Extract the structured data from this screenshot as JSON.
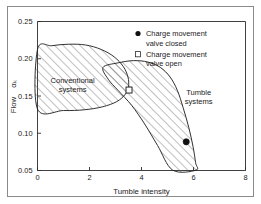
{
  "chart_data": {
    "type": "scatter",
    "title": "",
    "xlabel": "Tumble intensity",
    "ylabel": "Flow αₖ",
    "ylabel_main": "Flow",
    "ylabel_symbol": "αₖ",
    "xlim": [
      0,
      8
    ],
    "ylim": [
      0.05,
      0.25
    ],
    "xticks": [
      0,
      2,
      4,
      6,
      8
    ],
    "xtick_labels": [
      "0",
      "2",
      "4",
      "6",
      "8"
    ],
    "yticks": [
      0.05,
      0.1,
      0.15,
      0.2,
      0.25
    ],
    "ytick_labels": [
      "0.05",
      "0.10",
      "0.15",
      "0.20",
      "0.25"
    ],
    "grid": false,
    "legend_position": "top-right",
    "series": [
      {
        "name": "Charge movement valve closed",
        "marker": "filled-circle",
        "points": [
          {
            "x": 5.72,
            "y": 0.0885
          }
        ]
      },
      {
        "name": "Charge movement valve open",
        "marker": "open-square",
        "points": [
          {
            "x": 3.52,
            "y": 0.158
          }
        ]
      }
    ],
    "regions": [
      {
        "name": "Conventional systems",
        "label": "Conventional\nsystems",
        "label_line1": "Conventional",
        "label_line2": "systems",
        "hatch": "diagonal",
        "label_x": 1.35,
        "label_y": 0.168,
        "boundary": [
          {
            "x": 0.0,
            "y": 0.2125
          },
          {
            "x": 0.55,
            "y": 0.2175
          },
          {
            "x": 1.2,
            "y": 0.2195
          },
          {
            "x": 1.85,
            "y": 0.2185
          },
          {
            "x": 2.45,
            "y": 0.2125
          },
          {
            "x": 2.95,
            "y": 0.2025
          },
          {
            "x": 3.3,
            "y": 0.1895
          },
          {
            "x": 3.48,
            "y": 0.1755
          },
          {
            "x": 3.5,
            "y": 0.1625
          },
          {
            "x": 3.38,
            "y": 0.1525
          },
          {
            "x": 3.05,
            "y": 0.1425
          },
          {
            "x": 2.5,
            "y": 0.1355
          },
          {
            "x": 1.8,
            "y": 0.1315
          },
          {
            "x": 1.0,
            "y": 0.1305
          },
          {
            "x": 0.0,
            "y": 0.1325
          }
        ]
      },
      {
        "name": "Tumble systems",
        "label": "Tumble\nsystems",
        "label_line1": "Tumble",
        "label_line2": "systems",
        "hatch": "diagonal",
        "label_x": 6.2,
        "label_y": 0.152,
        "boundary": [
          {
            "x": 2.52,
            "y": 0.1885
          },
          {
            "x": 3.1,
            "y": 0.1945
          },
          {
            "x": 3.7,
            "y": 0.1975
          },
          {
            "x": 4.25,
            "y": 0.1955
          },
          {
            "x": 4.72,
            "y": 0.1885
          },
          {
            "x": 5.1,
            "y": 0.1755
          },
          {
            "x": 5.38,
            "y": 0.1575
          },
          {
            "x": 5.6,
            "y": 0.1345
          },
          {
            "x": 5.82,
            "y": 0.1075
          },
          {
            "x": 5.98,
            "y": 0.0825
          },
          {
            "x": 6.08,
            "y": 0.0605
          },
          {
            "x": 6.1,
            "y": 0.0505
          },
          {
            "x": 5.2,
            "y": 0.0505
          },
          {
            "x": 4.62,
            "y": 0.0835
          },
          {
            "x": 4.12,
            "y": 0.1125
          },
          {
            "x": 3.62,
            "y": 0.1375
          },
          {
            "x": 3.1,
            "y": 0.1575
          },
          {
            "x": 2.72,
            "y": 0.1725
          }
        ]
      }
    ]
  },
  "legend": {
    "items": [
      {
        "marker": "filled-circle",
        "line1": "Charge movement",
        "line2": "valve closed"
      },
      {
        "marker": "open-square",
        "line1": "Charge movement",
        "line2": "valve open"
      }
    ]
  },
  "colors": {
    "axis": "#2b2b2b",
    "text": "#1a1a1a",
    "hatch": "#555555",
    "outline": "#1a1a1a",
    "frame": "#8a8a8a",
    "background": "#ffffff"
  }
}
